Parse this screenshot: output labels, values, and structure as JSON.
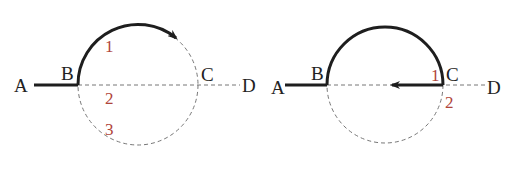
{
  "colors": {
    "path": "#1e1e1e",
    "dashed": "#777777",
    "number": "#b0453a",
    "background": "#ffffff"
  },
  "left_diagram": {
    "points": {
      "A": "A",
      "B": "B",
      "C": "C",
      "D": "D"
    },
    "region_numbers": {
      "n1": "1",
      "n2": "2",
      "n3": "3"
    },
    "path_description": "Solid path from A to B, then along upper arc of circle clockwise toward C with arrowhead"
  },
  "right_diagram": {
    "points": {
      "A": "A",
      "B": "B",
      "C": "C",
      "D": "D"
    },
    "region_numbers": {
      "n1": "1",
      "n2": "2"
    },
    "path_description": "Solid path A to B, upper semicircle B to C, then arrow from C back along diameter toward center"
  }
}
